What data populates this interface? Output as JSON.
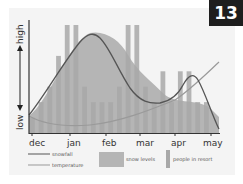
{
  "badge": "13",
  "chart_data": {
    "type": "bar+line+area",
    "title": "",
    "xlabel": "",
    "ylabel_low": "low",
    "ylabel_high": "high",
    "x_ticks": [
      "dec",
      "jan",
      "feb",
      "mar",
      "apr",
      "may"
    ],
    "legend": [
      {
        "name": "snowfall",
        "type": "line",
        "color": "#555555"
      },
      {
        "name": "temperature",
        "type": "line",
        "color": "#999999"
      },
      {
        "name": "snow levels",
        "type": "area",
        "color": "#b3b3b3"
      },
      {
        "name": "people in resort",
        "type": "bar",
        "color": "#a9a9a9"
      }
    ],
    "series": [
      {
        "name": "people in resort",
        "type": "bar",
        "values": [
          1,
          2,
          3,
          5,
          7,
          7,
          3,
          2,
          2,
          2,
          3,
          7,
          7,
          3,
          2,
          4,
          2,
          4,
          4,
          2,
          2
        ]
      },
      {
        "name": "snowfall",
        "type": "line",
        "shape": "peaks mid-January (high), trough late March, second peak mid-April, drops by May"
      },
      {
        "name": "temperature",
        "type": "line",
        "shape": "low through Jan-Feb, rising steadily to highest in May"
      },
      {
        "name": "snow levels",
        "type": "area",
        "shape": "rises to max late January/early February, declines through March-April, low by May"
      }
    ],
    "y_scale": "qualitative (low to high)"
  },
  "axis": {
    "months": [
      "dec",
      "jan",
      "feb",
      "mar",
      "apr",
      "may"
    ],
    "low": "low",
    "high": "high"
  },
  "legend": {
    "snowfall": "snowfall",
    "temperature": "temperature",
    "snow_levels": "snow levels",
    "people": "people in resort"
  }
}
